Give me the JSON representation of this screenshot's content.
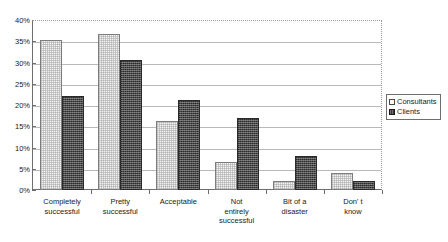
{
  "chart_data": {
    "type": "bar",
    "title": "",
    "xlabel": "",
    "ylabel": "",
    "ylim": [
      0,
      40
    ],
    "ytick_labels": [
      "40%",
      "35%",
      "30%",
      "25%",
      "20%",
      "15%",
      "10%",
      "5%",
      "0%"
    ],
    "ytick_values": [
      40,
      35,
      30,
      25,
      20,
      15,
      10,
      5,
      0
    ],
    "grid": true,
    "legend_position": "right",
    "categories": [
      "Completely successful",
      "Pretty successful",
      "Acceptable",
      "Not entirely successful",
      "Bit of a disaster",
      "Don' t know"
    ],
    "category_lines": [
      [
        "Completely",
        "successful"
      ],
      [
        "Pretty",
        "successful"
      ],
      [
        "Acceptable"
      ],
      [
        "Not",
        "entirely",
        "successful"
      ],
      [
        "Bit of a",
        "disaster"
      ],
      [
        "Don' t",
        "know"
      ]
    ],
    "series": [
      {
        "name": "Consultants",
        "color": "#f2f2f2",
        "values": [
          35.3,
          36.8,
          16.3,
          6.5,
          2.2,
          3.9
        ]
      },
      {
        "name": "Clients",
        "color": "#4a4a4a",
        "values": [
          22.2,
          30.6,
          21.2,
          17.0,
          7.9,
          2.2
        ]
      }
    ]
  },
  "legend": {
    "items": [
      {
        "label": "Consultants",
        "swatch": "consultants"
      },
      {
        "label": "Clients",
        "swatch": "clients"
      }
    ]
  },
  "title_remnant": ""
}
